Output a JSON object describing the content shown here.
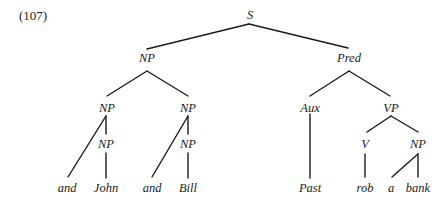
{
  "example_number": "(107)",
  "tree": {
    "nodes": [
      {
        "id": "S",
        "label": "S",
        "x": 250,
        "y": 19
      },
      {
        "id": "NP_top",
        "label": "NP",
        "x": 147,
        "y": 62
      },
      {
        "id": "Pred",
        "label": "Pred",
        "x": 349,
        "y": 62
      },
      {
        "id": "NP_left",
        "label": "NP",
        "x": 107,
        "y": 112
      },
      {
        "id": "NP_right",
        "label": "NP",
        "x": 188,
        "y": 112
      },
      {
        "id": "Aux",
        "label": "Aux",
        "x": 310,
        "y": 112
      },
      {
        "id": "VP",
        "label": "VP",
        "x": 391,
        "y": 112
      },
      {
        "id": "NP_left_inner",
        "label": "NP",
        "x": 106,
        "y": 148
      },
      {
        "id": "NP_right_inner",
        "label": "NP",
        "x": 188,
        "y": 148
      },
      {
        "id": "V",
        "label": "V",
        "x": 365,
        "y": 148
      },
      {
        "id": "NP_obj",
        "label": "NP",
        "x": 418,
        "y": 148
      },
      {
        "id": "and_1",
        "label": "and",
        "x": 67,
        "y": 192
      },
      {
        "id": "John",
        "label": "John",
        "x": 106,
        "y": 192
      },
      {
        "id": "and_2",
        "label": "and",
        "x": 152,
        "y": 192
      },
      {
        "id": "Bill",
        "label": "Bill",
        "x": 188,
        "y": 192
      },
      {
        "id": "Past",
        "label": "Past",
        "x": 310,
        "y": 192
      },
      {
        "id": "rob",
        "label": "rob",
        "x": 365,
        "y": 192
      },
      {
        "id": "a",
        "label": "a",
        "x": 391,
        "y": 192
      },
      {
        "id": "bank",
        "label": "bank",
        "x": 418,
        "y": 192
      }
    ],
    "edges": [
      {
        "from": "S",
        "to": "NP_top",
        "x1": 249,
        "y1": 24,
        "x2": 147,
        "y2": 49
      },
      {
        "from": "S",
        "to": "Pred",
        "x1": 249,
        "y1": 24,
        "x2": 348,
        "y2": 48
      },
      {
        "from": "NP_top",
        "to": "NP_left",
        "x1": 147,
        "y1": 71,
        "x2": 107,
        "y2": 96
      },
      {
        "from": "NP_top",
        "to": "NP_right",
        "x1": 147,
        "y1": 71,
        "x2": 188,
        "y2": 96
      },
      {
        "from": "Pred",
        "to": "Aux",
        "x1": 349,
        "y1": 71,
        "x2": 310,
        "y2": 96
      },
      {
        "from": "Pred",
        "to": "VP",
        "x1": 349,
        "y1": 71,
        "x2": 390,
        "y2": 96
      },
      {
        "from": "NP_left",
        "to": "and_1",
        "x1": 106,
        "y1": 116,
        "x2": 68,
        "y2": 177
      },
      {
        "from": "NP_left",
        "to": "NP_left_inner",
        "x1": 106,
        "y1": 116,
        "x2": 106,
        "y2": 134
      },
      {
        "from": "NP_left_inner",
        "to": "John",
        "x1": 106,
        "y1": 153,
        "x2": 106,
        "y2": 178
      },
      {
        "from": "NP_right",
        "to": "and_2",
        "x1": 188,
        "y1": 116,
        "x2": 152,
        "y2": 177
      },
      {
        "from": "NP_right",
        "to": "NP_right_inner",
        "x1": 188,
        "y1": 116,
        "x2": 188,
        "y2": 134
      },
      {
        "from": "NP_right_inner",
        "to": "Bill",
        "x1": 188,
        "y1": 153,
        "x2": 188,
        "y2": 178
      },
      {
        "from": "Aux",
        "to": "Past",
        "x1": 310,
        "y1": 114,
        "x2": 310,
        "y2": 178
      },
      {
        "from": "VP",
        "to": "V",
        "x1": 391,
        "y1": 116,
        "x2": 367,
        "y2": 132
      },
      {
        "from": "VP",
        "to": "NP_obj",
        "x1": 391,
        "y1": 116,
        "x2": 418,
        "y2": 132
      },
      {
        "from": "V",
        "to": "rob",
        "x1": 365,
        "y1": 154,
        "x2": 365,
        "y2": 177
      },
      {
        "from": "NP_obj",
        "to": "a",
        "x1": 418,
        "y1": 154,
        "x2": 392,
        "y2": 177
      },
      {
        "from": "NP_obj",
        "to": "bank",
        "x1": 418,
        "y1": 154,
        "x2": 418,
        "y2": 177
      }
    ]
  }
}
